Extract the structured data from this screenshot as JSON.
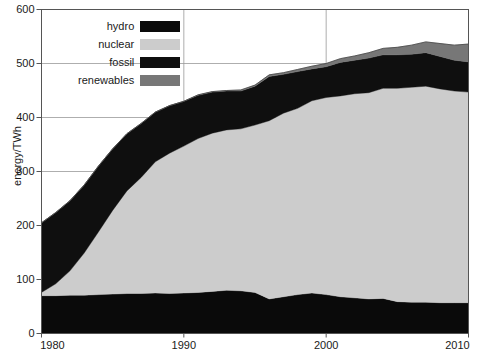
{
  "chart_data": {
    "type": "area",
    "stacked": true,
    "title": "",
    "xlabel": "",
    "ylabel": "energy/TWh",
    "xlim": [
      1980,
      2010
    ],
    "ylim": [
      0,
      600
    ],
    "xticks": [
      1980,
      1990,
      2000,
      2010
    ],
    "yticks": [
      0,
      100,
      200,
      300,
      400,
      500,
      600
    ],
    "grid": true,
    "legend_position": "top-left-inside",
    "x": [
      1980,
      1981,
      1982,
      1983,
      1984,
      1985,
      1986,
      1987,
      1988,
      1989,
      1990,
      1991,
      1992,
      1993,
      1994,
      1995,
      1996,
      1997,
      1998,
      1999,
      2000,
      2001,
      2002,
      2003,
      2004,
      2005,
      2006,
      2007,
      2008,
      2009,
      2010
    ],
    "series": [
      {
        "name": "hydro",
        "color": "#0a0a0a",
        "values": [
          70,
          70,
          71,
          71,
          72,
          73,
          74,
          74,
          75,
          74,
          75,
          76,
          78,
          80,
          79,
          76,
          64,
          68,
          72,
          75,
          72,
          68,
          66,
          64,
          65,
          59,
          58,
          58,
          57,
          57,
          57
        ]
      },
      {
        "name": "nuclear",
        "color": "#cccccc",
        "values": [
          6,
          22,
          45,
          78,
          116,
          155,
          190,
          215,
          243,
          260,
          272,
          285,
          293,
          297,
          300,
          310,
          330,
          340,
          345,
          356,
          365,
          372,
          378,
          382,
          389,
          395,
          398,
          400,
          396,
          392,
          390
        ]
      },
      {
        "name": "fossil",
        "color": "#0f0f0f",
        "values": [
          129,
          132,
          130,
          126,
          122,
          114,
          106,
          100,
          92,
          88,
          83,
          80,
          76,
          72,
          70,
          72,
          82,
          72,
          68,
          59,
          57,
          62,
          62,
          64,
          62,
          62,
          61,
          62,
          60,
          57,
          56
        ]
      },
      {
        "name": "renewables",
        "color": "#777777",
        "values": [
          0,
          0,
          0,
          0,
          0,
          0,
          0,
          0,
          0,
          0,
          0,
          1,
          1,
          1,
          2,
          2,
          3,
          3,
          4,
          5,
          6,
          7,
          8,
          10,
          12,
          14,
          17,
          20,
          24,
          28,
          33
        ]
      }
    ]
  },
  "legend": {
    "entries": [
      {
        "label": "hydro",
        "color": "#0a0a0a"
      },
      {
        "label": "nuclear",
        "color": "#cccccc"
      },
      {
        "label": "fossil",
        "color": "#0f0f0f"
      },
      {
        "label": "renewables",
        "color": "#777777"
      }
    ]
  },
  "axes": {
    "y_label": "energy/TWh",
    "y_tick_labels": [
      "0",
      "100",
      "200",
      "300",
      "400",
      "500",
      "600"
    ],
    "x_tick_labels": [
      "1980",
      "1990",
      "2000",
      "2010"
    ]
  },
  "colors": {
    "background": "#ffffff",
    "axis": "#555555",
    "grid": "#999999",
    "text": "#1a1a1a"
  }
}
